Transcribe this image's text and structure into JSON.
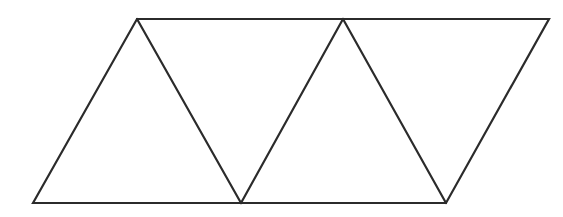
{
  "figure": {
    "background_color": "#ffffff",
    "stroke_color": "#2b2b2b",
    "fill_color": "#ffffff",
    "stroke_width": 2.2,
    "canvas": {
      "width": 563,
      "height": 217
    },
    "vertices": {
      "bottom_left": {
        "label": "A",
        "x": 33,
        "y": 203
      },
      "top_left": {
        "label": "B",
        "x": 137,
        "y": 19
      },
      "bottom_mid": {
        "label": "C",
        "x": 241,
        "y": 203
      },
      "top_mid": {
        "label": "D",
        "x": 343,
        "y": 19
      },
      "bottom_right": {
        "label": "E",
        "x": 446,
        "y": 203
      },
      "top_right": {
        "label": "F",
        "x": 549,
        "y": 19
      }
    },
    "outline_points": "33,203 137,19 343,19 549,19 446,203 241,203",
    "edges": [
      {
        "name": "top-edge",
        "from": "B",
        "to": "F",
        "points": "137,19 549,19"
      },
      {
        "name": "bottom-edge",
        "from": "A",
        "to": "E",
        "points": "33,203 446,203"
      },
      {
        "name": "left-edge",
        "from": "A",
        "to": "B",
        "points": "33,203 137,19"
      },
      {
        "name": "right-edge",
        "from": "F",
        "to": "E",
        "points": "549,19 446,203"
      }
    ],
    "internal_segments": [
      {
        "name": "diagonal-1",
        "from": "B",
        "to": "C",
        "points": "137,19 241,203"
      },
      {
        "name": "diagonal-2",
        "from": "C",
        "to": "D",
        "points": "241,203 343,19"
      },
      {
        "name": "diagonal-3",
        "from": "D",
        "to": "E",
        "points": "343,19 446,203"
      }
    ],
    "triangles": [
      {
        "name": "triangle-1-up",
        "orientation": "up",
        "points": "33,203 137,19 241,203"
      },
      {
        "name": "triangle-2-down",
        "orientation": "down",
        "points": "137,19 343,19 241,203"
      },
      {
        "name": "triangle-3-up",
        "orientation": "up",
        "points": "241,203 343,19 446,203"
      },
      {
        "name": "triangle-4-down",
        "orientation": "down",
        "points": "343,19 549,19 446,203"
      }
    ],
    "triangle_count": 4
  }
}
